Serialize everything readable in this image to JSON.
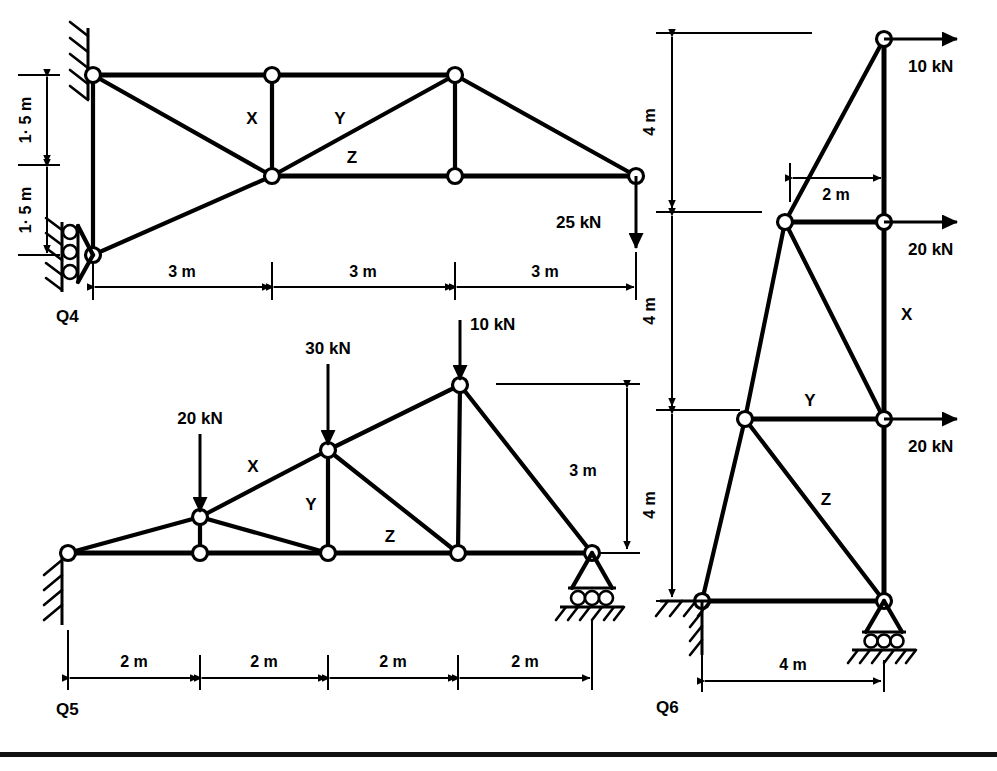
{
  "page": {
    "background": "#ffffff",
    "ink": "#000000"
  },
  "figures": [
    {
      "id": "Q4",
      "label": "Q4",
      "description": "Cantilever truss fixed at wall on left with 25 kN downward load at free right end",
      "span_dimensions": [
        "3 m",
        "3 m",
        "3 m"
      ],
      "height_dimensions": [
        "1· 5 m",
        "1· 5 m"
      ],
      "members_labeled": [
        "X",
        "Y",
        "Z"
      ],
      "loads": [
        {
          "magnitude": "25 kN",
          "direction": "down"
        }
      ],
      "supports": [
        "wall-hatch-top",
        "vertical-roller-bottom"
      ]
    },
    {
      "id": "Q5",
      "label": "Q5",
      "description": "Inclined top chord truss, pin at left wall, roller at right, three downward point loads",
      "span_dimensions": [
        "2 m",
        "2 m",
        "2 m",
        "2 m"
      ],
      "height_dimensions": [
        "3 m"
      ],
      "members_labeled": [
        "X",
        "Y",
        "Z"
      ],
      "loads": [
        {
          "magnitude": "20 kN",
          "direction": "down"
        },
        {
          "magnitude": "30 kN",
          "direction": "down"
        },
        {
          "magnitude": "10 kN",
          "direction": "down"
        }
      ],
      "supports": [
        "pin-wall-left",
        "roller-right"
      ]
    },
    {
      "id": "Q6",
      "label": "Q6",
      "description": "Vertical cantilever tower truss with three horizontal loads to the right",
      "height_dimensions": [
        "4 m",
        "4 m",
        "4 m"
      ],
      "width_dimensions": [
        "2 m",
        "4 m"
      ],
      "members_labeled": [
        "X",
        "Y",
        "Z"
      ],
      "loads": [
        {
          "magnitude": "10 kN",
          "direction": "right"
        },
        {
          "magnitude": "20 kN",
          "direction": "right"
        },
        {
          "magnitude": "20 kN",
          "direction": "right"
        }
      ],
      "supports": [
        "pin-wall-bottom-left",
        "roller-bottom-right"
      ]
    }
  ],
  "q4": {
    "fig_label": "Q4",
    "dim_h1": "3 m",
    "dim_h2": "3 m",
    "dim_h3": "3 m",
    "dim_v1": "1· 5 m",
    "dim_v2": "1· 5 m",
    "member_x": "X",
    "member_y": "Y",
    "member_z": "Z",
    "load_1": "25 kN"
  },
  "q5": {
    "fig_label": "Q5",
    "dim_h1": "2 m",
    "dim_h2": "2 m",
    "dim_h3": "2 m",
    "dim_h4": "2 m",
    "dim_v1": "3 m",
    "member_x": "X",
    "member_y": "Y",
    "member_z": "Z",
    "load_1": "20 kN",
    "load_2": "30 kN",
    "load_3": "10 kN"
  },
  "q6": {
    "fig_label": "Q6",
    "dim_v1": "4 m",
    "dim_v2": "4 m",
    "dim_v3": "4 m",
    "dim_h_top": "2 m",
    "dim_h_base": "4 m",
    "member_x": "X",
    "member_y": "Y",
    "member_z": "Z",
    "load_1": "10 kN",
    "load_2": "20 kN",
    "load_3": "20 kN"
  }
}
